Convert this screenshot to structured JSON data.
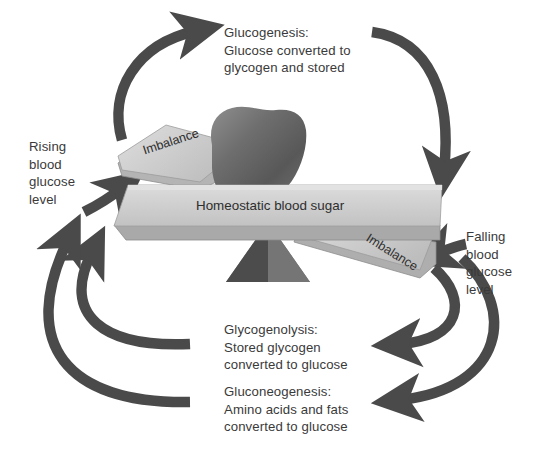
{
  "diagram": {
    "labels": {
      "glucogenesis": "Glucogenesis:\nGlucose converted to\nglycogen and stored",
      "glycogenolysis": "Glycogenolysis:\nStored glycogen\nconverted to glucose",
      "gluconeogenesis": "Gluconeogenesis:\nAmino acids and fats\nconverted to glucose",
      "rising": "Rising\nblood\nglucose\nlevel",
      "falling": "Falling\nblood\nglucose\nlevel"
    },
    "balance": {
      "center_plank": "Homeostatic blood sugar",
      "left_plank": "Imbalance",
      "right_plank": "Imbalance"
    },
    "shapes": {
      "liver": "liver-organ",
      "fulcrum": "triangle-fulcrum"
    },
    "colors": {
      "arrow": "#4a4a4a",
      "plank_face": "#c9c9c9",
      "plank_top": "#d7d7d7",
      "plank_edge": "#9a9a9a",
      "fulcrum_dark": "#4f4f4f",
      "fulcrum_light": "#7c7c7c",
      "liver_dark": "#5a5a5a",
      "liver_light": "#a8a8a8",
      "text": "#3a3a3a",
      "background": "#ffffff"
    }
  }
}
